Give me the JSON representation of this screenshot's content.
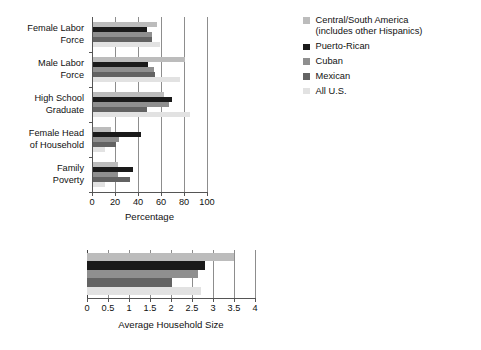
{
  "legend": {
    "items": [
      {
        "label": "Central/South America\n(includes other Hispanics)",
        "color": "#bcbcbc",
        "key": "central_south_america"
      },
      {
        "label": "Puerto-Rican",
        "color": "#1a1a1a",
        "key": "puerto_rican"
      },
      {
        "label": "Cuban",
        "color": "#8f8f8f",
        "key": "cuban"
      },
      {
        "label": "Mexican",
        "color": "#636363",
        "key": "mexican"
      },
      {
        "label": "All U.S.",
        "color": "#e2e2e2",
        "key": "all_us"
      }
    ]
  },
  "chart_data": [
    {
      "id": "percentage-chart",
      "type": "bar",
      "orientation": "horizontal",
      "title": "",
      "xlabel": "Percentage",
      "ylabel": "",
      "xlim": [
        0,
        100
      ],
      "xticks": [
        0,
        20,
        40,
        60,
        80,
        100
      ],
      "xtick_labels": [
        "0",
        "20",
        "40",
        "60",
        "80",
        "100"
      ],
      "grid": true,
      "legend_position": "right",
      "categories": [
        "Female Labor\nForce",
        "Male Labor\nForce",
        "High School\nGraduate",
        "Female Head\nof Household",
        "Family\nPoverty"
      ],
      "series": [
        {
          "name": "Central/South America (includes other Hispanics)",
          "color": "#bcbcbc",
          "values": [
            56,
            80,
            62,
            16,
            22
          ]
        },
        {
          "name": "Puerto-Rican",
          "color": "#1a1a1a",
          "values": [
            47,
            48,
            69,
            42,
            35
          ]
        },
        {
          "name": "Cuban",
          "color": "#8f8f8f",
          "values": [
            51,
            53,
            66,
            23,
            22
          ]
        },
        {
          "name": "Mexican",
          "color": "#636363",
          "values": [
            51,
            54,
            47,
            20,
            32
          ]
        },
        {
          "name": "All U.S.",
          "color": "#e2e2e2",
          "values": [
            58,
            76,
            84,
            10,
            10
          ]
        }
      ]
    },
    {
      "id": "household-size-chart",
      "type": "bar",
      "orientation": "horizontal",
      "title": "",
      "xlabel": "Average Household Size",
      "ylabel": "",
      "xlim": [
        0,
        4
      ],
      "xticks": [
        0,
        0.5,
        1,
        1.5,
        2,
        2.5,
        3,
        3.5,
        4
      ],
      "xtick_labels": [
        "0",
        "0.5",
        "1",
        "1.5",
        "2",
        "2.5",
        "3",
        "3.5",
        "4"
      ],
      "grid": true,
      "legend_position": "shared-right",
      "categories": [
        ""
      ],
      "series": [
        {
          "name": "Central/South America (includes other Hispanics)",
          "color": "#bcbcbc",
          "values": [
            3.5
          ]
        },
        {
          "name": "Puerto-Rican",
          "color": "#1a1a1a",
          "values": [
            2.8
          ]
        },
        {
          "name": "Cuban",
          "color": "#8f8f8f",
          "values": [
            2.65
          ]
        },
        {
          "name": "Mexican",
          "color": "#636363",
          "values": [
            2.02
          ]
        },
        {
          "name": "All U.S.",
          "color": "#e2e2e2",
          "values": [
            2.72
          ]
        }
      ]
    }
  ]
}
